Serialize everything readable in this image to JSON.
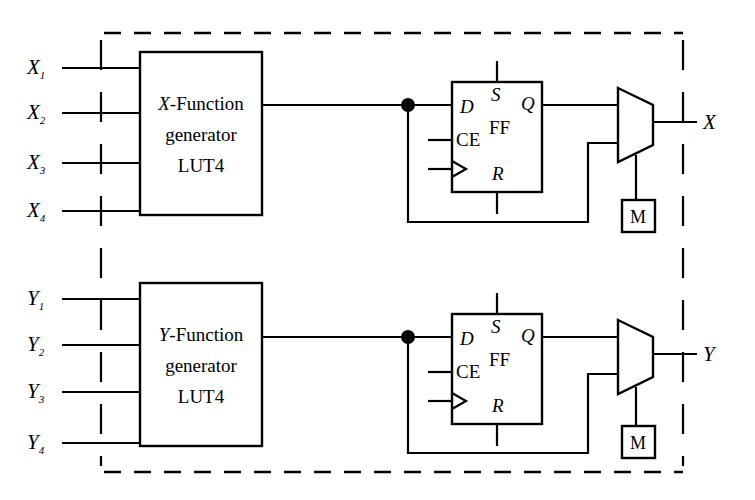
{
  "diagram": {
    "boundary": {
      "style": "dashed",
      "color": "#000000"
    },
    "line_color": "#000000",
    "background": "#ffffff",
    "slices": [
      {
        "id": "x-slice",
        "prefix": "X",
        "inputs": [
          {
            "base": "X",
            "index": "1",
            "label": "X1"
          },
          {
            "base": "X",
            "index": "2",
            "label": "X2"
          },
          {
            "base": "X",
            "index": "3",
            "label": "X3"
          },
          {
            "base": "X",
            "index": "4",
            "label": "X4"
          }
        ],
        "lut": {
          "line1_italic": "X",
          "line1_rest": "-Function",
          "line2": "generator",
          "line3": "LUT4"
        },
        "flipflop": {
          "name": "FF",
          "d": "D",
          "s": "S",
          "q": "Q",
          "ce": "CE",
          "r": "R"
        },
        "mux": {
          "name": "mux"
        },
        "memory_cell": {
          "label": "M"
        },
        "output": {
          "label": "X"
        }
      },
      {
        "id": "y-slice",
        "prefix": "Y",
        "inputs": [
          {
            "base": "Y",
            "index": "1",
            "label": "Y1"
          },
          {
            "base": "Y",
            "index": "2",
            "label": "Y2"
          },
          {
            "base": "Y",
            "index": "3",
            "label": "Y3"
          },
          {
            "base": "Y",
            "index": "4",
            "label": "Y4"
          }
        ],
        "lut": {
          "line1_italic": "Y",
          "line1_rest": "-Function",
          "line2": "generator",
          "line3": "LUT4"
        },
        "flipflop": {
          "name": "FF",
          "d": "D",
          "s": "S",
          "q": "Q",
          "ce": "CE",
          "r": "R"
        },
        "mux": {
          "name": "mux"
        },
        "memory_cell": {
          "label": "M"
        },
        "output": {
          "label": "Y"
        }
      }
    ]
  }
}
